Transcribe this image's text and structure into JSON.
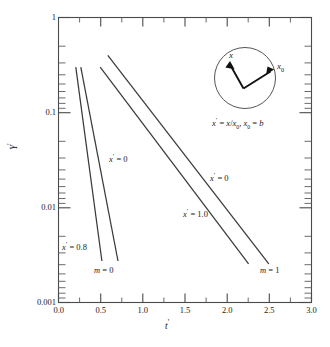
{
  "chart_data": {
    "type": "line",
    "title": "",
    "xlabel": "t'",
    "ylabel": "Y'",
    "xscale": "linear",
    "yscale": "log",
    "xlim": [
      0.0,
      3.0
    ],
    "ylim": [
      0.001,
      1
    ],
    "grid": false,
    "legend": "none (inline curve annotations)",
    "x_ticks": [
      "0.0",
      "0.5",
      "1.0",
      "1.5",
      "2.0",
      "2.5",
      "3.0"
    ],
    "x_tick_values": [
      0.0,
      0.5,
      1.0,
      1.5,
      2.0,
      2.5,
      3.0
    ],
    "x_minor_tick_values": [
      0.25,
      0.75,
      1.25,
      1.75,
      2.25,
      2.75
    ],
    "y_ticks": [
      "1",
      "0.1",
      "0.01",
      "0.001"
    ],
    "y_tick_values": [
      1,
      0.1,
      0.01,
      0.001
    ],
    "y_minor_decade_multipliers": [
      2,
      3,
      4,
      5,
      6,
      7,
      8,
      9
    ],
    "series": [
      {
        "name": "m = 0, x' = 0.8",
        "group": "m=0",
        "annotation": "x' = 0.8",
        "points": [
          [
            0.205,
            0.3
          ],
          [
            0.515,
            0.0035
          ]
        ],
        "comment": "leftmost straight line on semilog axes"
      },
      {
        "name": "m = 0, x' = 0",
        "group": "m=0",
        "annotation": "x' = 0",
        "points": [
          [
            0.265,
            0.3
          ],
          [
            0.705,
            0.0035
          ]
        ],
        "comment": "second line from left"
      },
      {
        "name": "m = 1, x' = 1.0",
        "group": "m=1",
        "annotation": "x' = 1.0",
        "points": [
          [
            0.495,
            0.3
          ],
          [
            2.255,
            0.0033
          ]
        ],
        "comment": "third line, shallower slope"
      },
      {
        "name": "m = 1, x' = 0",
        "group": "m=1",
        "annotation": "x' = 0",
        "points": [
          [
            0.585,
            0.4
          ],
          [
            2.495,
            0.0033
          ]
        ],
        "comment": "rightmost line, starts highest"
      }
    ],
    "curve_labels": [
      {
        "text": "x' = 0",
        "x": 0.62,
        "y": 0.056,
        "for": "m=0 group"
      },
      {
        "text": "x' = 0.8",
        "x": 0.1,
        "y": 0.0055,
        "for": "m=0 group"
      },
      {
        "text": "m = 0",
        "x": 0.53,
        "y": 0.00235,
        "for": "m=0 group"
      },
      {
        "text": "x' = 0",
        "x": 1.82,
        "y": 0.0345,
        "for": "m=1 group"
      },
      {
        "text": "x' = 1.0",
        "x": 1.49,
        "y": 0.0086,
        "for": "m=1 group"
      },
      {
        "text": "m = 1",
        "x": 2.42,
        "y": 0.00235,
        "for": "m=1 group"
      }
    ],
    "inset": {
      "shape": "circle",
      "caption": "x' = x/x0, x0 = b",
      "caption_parts": [
        "x",
        "'",
        " = ",
        "x",
        "/",
        "x",
        "0",
        ", ",
        "x",
        "0",
        " = ",
        "b"
      ],
      "arrows": [
        {
          "label": "x",
          "direction": "up-left",
          "from": "interior vertex",
          "to": "interior point"
        },
        {
          "label": "x0",
          "direction": "right",
          "from": "interior vertex",
          "to": "circle edge"
        }
      ],
      "arrow_labels": [
        "x",
        "x0"
      ]
    }
  },
  "axis": {
    "y_label_main": "Y",
    "y_label_prime": "'",
    "x_label_main": "t",
    "x_label_prime": "'"
  },
  "colors": {
    "line": "#3a3a3a",
    "frame": "#4a4a4a",
    "text": "#1a1a1a",
    "background": "#ffffff"
  }
}
